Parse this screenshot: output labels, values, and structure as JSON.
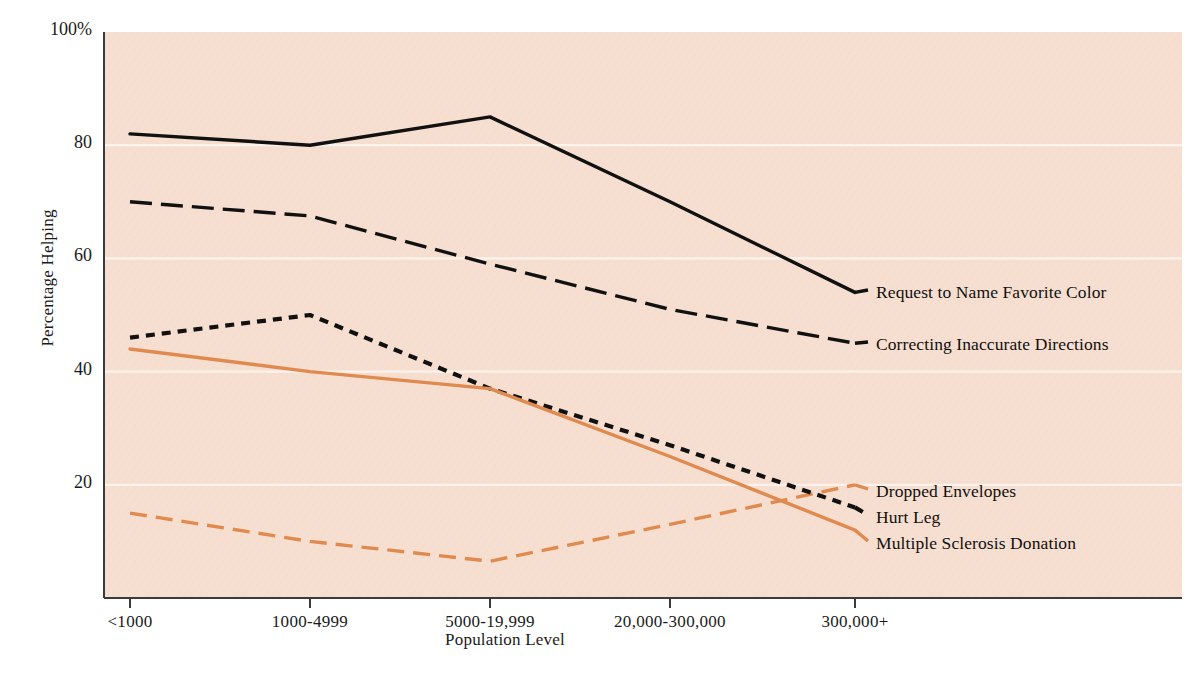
{
  "chart_data": {
    "type": "line",
    "title": "",
    "xlabel": "Population Level",
    "ylabel": "Percentage Helping",
    "categories": [
      "<1000",
      "1000-4999",
      "5000-19,999",
      "20,000-300,000",
      "300,000+"
    ],
    "ylim": [
      0,
      100
    ],
    "ytick_labels": [
      "100%",
      "80",
      "60",
      "40",
      "20"
    ],
    "ytick_values": [
      100,
      80,
      60,
      40,
      20
    ],
    "grid": "horizontal-white",
    "legend_position": "right-inline-annotations",
    "plot_background": "#f6dfd0",
    "gridline_color": "#fdf3ec",
    "series": [
      {
        "name": "Request to Name Favorite Color",
        "values": [
          82,
          80,
          85,
          70,
          54
        ],
        "color": "#111111",
        "style": "solid",
        "label_y": 296
      },
      {
        "name": "Correcting Inaccurate Directions",
        "values": [
          70,
          67.5,
          59,
          51,
          45
        ],
        "color": "#111111",
        "style": "dashed",
        "label_y": 348
      },
      {
        "name": "Dropped Envelopes",
        "values": [
          15,
          10,
          6.5,
          13,
          20
        ],
        "color": "#e08a50",
        "style": "dashed",
        "label_y": 495
      },
      {
        "name": "Hurt Leg",
        "values": [
          46,
          50,
          37,
          27,
          16
        ],
        "color": "#111111",
        "style": "dotted",
        "label_y": 521
      },
      {
        "name": "Multiple Sclerosis Donation",
        "values": [
          44,
          40,
          37,
          25,
          12
        ],
        "color": "#e08a50",
        "style": "solid",
        "label_y": 547
      }
    ]
  },
  "axes": {
    "y_title": "Percentage Helping",
    "x_title": "Population Level"
  }
}
